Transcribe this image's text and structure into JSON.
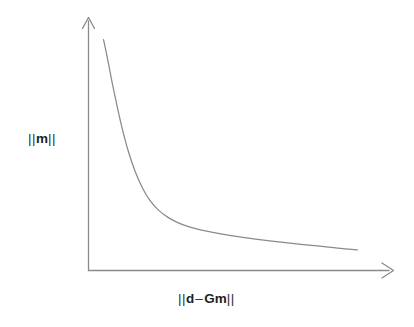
{
  "figure": {
    "background_color": "#ffffff",
    "line_color": "#8a8a8a",
    "text_color": "#2b2b2b"
  },
  "y_axis": {
    "label_open_bars": "||",
    "label_symbol": "m",
    "label_close_bars": "||",
    "label_full": "|| m ||"
  },
  "x_axis": {
    "label_open_bars": "||",
    "label_symbol_1": "d",
    "label_operator": "–",
    "label_symbol_2": "Gm",
    "label_close_bars": "||",
    "label_full": "|| d – Gm ||"
  },
  "chart_data": {
    "type": "line",
    "title": "",
    "subtitle": "",
    "xlabel": "|| d – Gm ||",
    "ylabel": "|| m ||",
    "grid": false,
    "legend": null,
    "legend_position": "none",
    "axis_style": "arrow-tipped open axes (no tick marks, no tick labels)",
    "xlim": [
      0,
      1
    ],
    "ylim": [
      0,
      1
    ],
    "xticks": [],
    "yticks": [],
    "series": [
      {
        "name": "L-curve",
        "color": "#8a8a8a",
        "x": [
          0.05,
          0.058,
          0.068,
          0.08,
          0.095,
          0.112,
          0.132,
          0.155,
          0.18,
          0.205,
          0.232,
          0.262,
          0.295,
          0.335,
          0.385,
          0.445,
          0.52,
          0.61,
          0.715,
          0.83,
          0.895
        ],
        "y": [
          0.925,
          0.88,
          0.82,
          0.745,
          0.66,
          0.57,
          0.48,
          0.398,
          0.33,
          0.28,
          0.243,
          0.215,
          0.193,
          0.175,
          0.16,
          0.146,
          0.132,
          0.118,
          0.104,
          0.09,
          0.083
        ]
      }
    ]
  }
}
